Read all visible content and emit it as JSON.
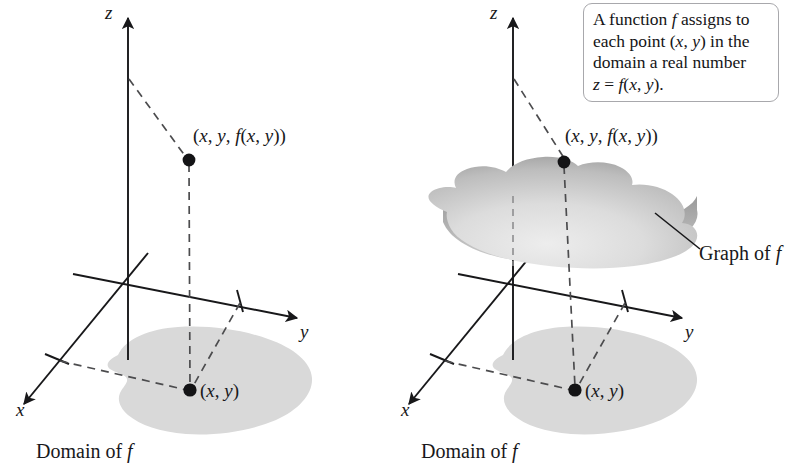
{
  "figure": {
    "title": "",
    "background_color": "#ffffff",
    "ink_color": "#18181a",
    "domain_fill_color": "#d9d9d9",
    "surface_dark_color": "#8d8d8d",
    "surface_light_color": "#e4e4e4",
    "callout_border_color": "#a8a8ac"
  },
  "left_panel": {
    "axes": {
      "z_label": "z",
      "y_label": "y",
      "x_label": "x"
    },
    "point_upper_label": "(x, y, f(x, y))",
    "point_lower_label": "(x, y)",
    "domain_label": "Domain of f"
  },
  "right_panel": {
    "axes": {
      "z_label": "z",
      "y_label": "y",
      "x_label": "x"
    },
    "point_upper_label": "(x, y, f(x, y))",
    "point_lower_label": "(x, y)",
    "domain_label": "Domain of f",
    "graph_label": "Graph of f"
  },
  "callout": {
    "line1": "A function f assigns to",
    "line2": "each point (x, y) in the",
    "line3": "domain a real number",
    "line4": "z = f(x, y)."
  },
  "chart_data": {
    "type": "diagram",
    "panels": [
      {
        "name": "left",
        "axes": [
          "x",
          "y",
          "z"
        ],
        "elements": [
          "z-axis vertical with arrowhead",
          "y-axis to lower right with arrowhead and one tick",
          "x-axis to lower left with arrowhead and one tick",
          "gray domain region in xy-plane labeled Domain of f",
          "solid dot at (x, y) inside domain",
          "solid dot at (x, y, f(x, y)) above domain",
          "dashed vertical segment joining the two dots",
          "dashed leader from z-axis to upper dot",
          "dashed leaders from x tick and y tick to lower dot"
        ]
      },
      {
        "name": "right",
        "axes": [
          "x",
          "y",
          "z"
        ],
        "elements": [
          "z-axis vertical with arrowhead",
          "y-axis to lower right with arrowhead and one tick",
          "x-axis to lower left with arrowhead and one tick",
          "gray domain region in xy-plane labeled Domain of f",
          "shaded blob surface above the domain labeled Graph of f",
          "solid dot at (x, y) inside domain",
          "solid dot at (x, y, f(x, y)) on the surface",
          "dashed vertical segment joining the two dots",
          "dashed leader from z-axis to the surface point",
          "leader line from surface edge to the Graph of f label",
          "rounded rectangle callout with explanatory text"
        ]
      }
    ]
  }
}
